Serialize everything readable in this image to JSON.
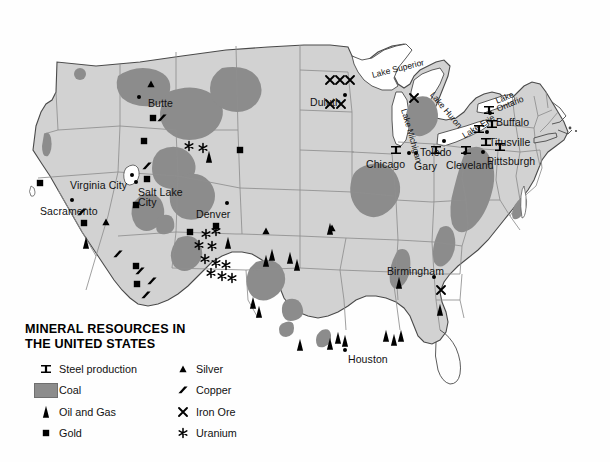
{
  "title": {
    "line1": "MINERAL RESOURCES IN",
    "line2": "THE UNITED STATES"
  },
  "legend": {
    "left_column": [
      {
        "symbol": "steel-production-icon",
        "label": "Steel production"
      },
      {
        "symbol": "coal-swatch-icon",
        "label": "Coal"
      },
      {
        "symbol": "oil-and-gas-icon",
        "label": "Oil and Gas"
      },
      {
        "symbol": "gold-icon",
        "label": "Gold"
      }
    ],
    "right_column": [
      {
        "symbol": "silver-icon",
        "label": "Silver"
      },
      {
        "symbol": "copper-icon",
        "label": "Copper"
      },
      {
        "symbol": "iron-ore-icon",
        "label": "Iron Ore"
      },
      {
        "symbol": "uranium-icon",
        "label": "Uranium"
      }
    ]
  },
  "cities": [
    {
      "name": "Butte",
      "x": 148,
      "y": 97
    },
    {
      "name": "Duluth",
      "x": 310,
      "y": 96
    },
    {
      "name": "Virginia City",
      "x": 70,
      "y": 179
    },
    {
      "name": "Sacramento",
      "x": 40,
      "y": 205
    },
    {
      "name": "Salt Lake",
      "x": 138,
      "y": 186
    },
    {
      "name": "City",
      "x": 138,
      "y": 196
    },
    {
      "name": "Denver",
      "x": 196,
      "y": 208
    },
    {
      "name": "Chicago",
      "x": 366,
      "y": 158
    },
    {
      "name": "Gary",
      "x": 414,
      "y": 160
    },
    {
      "name": "Toledo",
      "x": 420,
      "y": 146
    },
    {
      "name": "Cleveland",
      "x": 446,
      "y": 159
    },
    {
      "name": "Pittsburgh",
      "x": 487,
      "y": 155
    },
    {
      "name": "Titusville",
      "x": 489,
      "y": 136
    },
    {
      "name": "Buffalo",
      "x": 496,
      "y": 116
    },
    {
      "name": "Birmingham",
      "x": 387,
      "y": 265
    },
    {
      "name": "Houston",
      "x": 348,
      "y": 353
    }
  ],
  "lakes": [
    {
      "name": "Lake Superior",
      "x": 372,
      "y": 70,
      "rot": -14
    },
    {
      "name": "Lake Michigan",
      "x": 404,
      "y": 104,
      "rot": 74
    },
    {
      "name": "Lake Huron",
      "x": 432,
      "y": 88,
      "rot": 50
    },
    {
      "name": "Lake Erie",
      "x": 463,
      "y": 131,
      "rot": -32
    },
    {
      "name": "Lake",
      "x": 496,
      "y": 96,
      "rot": -22
    },
    {
      "name": "Ontario",
      "x": 497,
      "y": 104,
      "rot": -22
    }
  ],
  "markers": {
    "steel_production": [
      {
        "x": 396,
        "y": 150
      },
      {
        "x": 436,
        "y": 150
      },
      {
        "x": 466,
        "y": 150
      },
      {
        "x": 486,
        "y": 142
      },
      {
        "x": 500,
        "y": 147
      },
      {
        "x": 479,
        "y": 129
      },
      {
        "x": 492,
        "y": 124
      },
      {
        "x": 489,
        "y": 110
      }
    ],
    "iron_ore": [
      {
        "x": 330,
        "y": 80
      },
      {
        "x": 340,
        "y": 80
      },
      {
        "x": 350,
        "y": 80
      },
      {
        "x": 330,
        "y": 104
      },
      {
        "x": 341,
        "y": 104
      },
      {
        "x": 414,
        "y": 98
      },
      {
        "x": 441,
        "y": 290
      }
    ],
    "gold": [
      {
        "x": 153,
        "y": 118
      },
      {
        "x": 144,
        "y": 141
      },
      {
        "x": 40,
        "y": 183
      },
      {
        "x": 84,
        "y": 223
      },
      {
        "x": 147,
        "y": 179
      },
      {
        "x": 136,
        "y": 205
      },
      {
        "x": 240,
        "y": 150
      },
      {
        "x": 190,
        "y": 232
      },
      {
        "x": 216,
        "y": 226
      },
      {
        "x": 136,
        "y": 266
      },
      {
        "x": 137,
        "y": 284
      }
    ],
    "silver": [
      {
        "x": 151,
        "y": 84
      },
      {
        "x": 106,
        "y": 222
      },
      {
        "x": 266,
        "y": 231
      },
      {
        "x": 332,
        "y": 228
      }
    ],
    "copper": [
      {
        "x": 162,
        "y": 118
      },
      {
        "x": 147,
        "y": 166
      },
      {
        "x": 82,
        "y": 212
      },
      {
        "x": 118,
        "y": 254
      },
      {
        "x": 140,
        "y": 271
      },
      {
        "x": 152,
        "y": 281
      },
      {
        "x": 146,
        "y": 295
      }
    ],
    "uranium": [
      {
        "x": 189,
        "y": 146
      },
      {
        "x": 203,
        "y": 148
      },
      {
        "x": 206,
        "y": 234
      },
      {
        "x": 216,
        "y": 231
      },
      {
        "x": 199,
        "y": 245
      },
      {
        "x": 212,
        "y": 246
      },
      {
        "x": 205,
        "y": 259
      },
      {
        "x": 216,
        "y": 263
      },
      {
        "x": 226,
        "y": 265
      },
      {
        "x": 211,
        "y": 273
      },
      {
        "x": 222,
        "y": 276
      },
      {
        "x": 232,
        "y": 278
      }
    ],
    "oil_and_gas": [
      {
        "x": 86,
        "y": 243
      },
      {
        "x": 209,
        "y": 157
      },
      {
        "x": 228,
        "y": 243
      },
      {
        "x": 266,
        "y": 261
      },
      {
        "x": 272,
        "y": 255
      },
      {
        "x": 290,
        "y": 258
      },
      {
        "x": 297,
        "y": 265
      },
      {
        "x": 330,
        "y": 229
      },
      {
        "x": 253,
        "y": 303
      },
      {
        "x": 259,
        "y": 312
      },
      {
        "x": 300,
        "y": 345
      },
      {
        "x": 330,
        "y": 344
      },
      {
        "x": 338,
        "y": 338
      },
      {
        "x": 345,
        "y": 341
      },
      {
        "x": 386,
        "y": 336
      },
      {
        "x": 394,
        "y": 340
      },
      {
        "x": 401,
        "y": 336
      },
      {
        "x": 399,
        "y": 283
      },
      {
        "x": 440,
        "y": 310
      }
    ]
  },
  "colors": {
    "land": "#d2d2d2",
    "coal": "#8c8c8c",
    "border": "#8f8f8f",
    "outline": "#4a4a4a",
    "water": "#ffffff",
    "text": "#111111"
  }
}
